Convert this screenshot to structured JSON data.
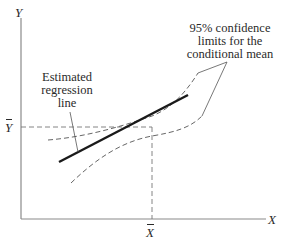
{
  "diagram": {
    "title": "",
    "axes": {
      "x_label": "X",
      "y_label": "Y",
      "x_mean_label": "X",
      "y_mean_label": "Y",
      "x_mean_has_bar": true,
      "y_mean_has_bar": true
    },
    "annotations": {
      "regression_label": "Estimated\nregression\nline",
      "confidence_label": "95%  confidence\nlimits for the\nconditional mean"
    },
    "colors": {
      "axis": "#8a8a8a",
      "regression_line": "#1a1a1a",
      "confidence_band": "#555555",
      "guide_lines": "#777777",
      "text": "#2a2a2a"
    },
    "geometry": {
      "origin": [
        21,
        219
      ],
      "x_axis_end": [
        266,
        219
      ],
      "y_axis_top": [
        21,
        18
      ],
      "mean_point": [
        152,
        127
      ],
      "regression_line": {
        "start": [
          59,
          162
        ],
        "end": [
          188,
          95
        ]
      },
      "upper_band": "M48,140 C85,137 120,127 152,116 C172,108 186,92 198,73",
      "lower_band": "M71,183 C95,160 120,142 152,136 C175,132 190,128 202,116",
      "regression_leader": [
        [
          70,
          112
        ],
        [
          78,
          152
        ]
      ],
      "confidence_leaders": [
        [
          [
            198,
            73
          ],
          [
            227,
            62
          ]
        ],
        [
          [
            202,
            116
          ],
          [
            227,
            62
          ]
        ]
      ]
    }
  }
}
